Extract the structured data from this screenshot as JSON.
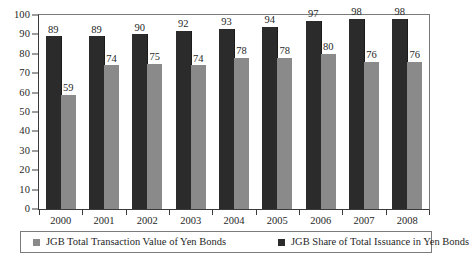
{
  "chart_data": {
    "type": "bar",
    "title": "",
    "subtitle": "",
    "xlabel": "",
    "ylabel": "",
    "ylim": [
      0,
      100
    ],
    "ytick_step": 10,
    "yticks": [
      100,
      90,
      80,
      70,
      60,
      50,
      40,
      30,
      20,
      10,
      0
    ],
    "grid": false,
    "legend_position": "bottom",
    "categories": [
      "2000",
      "2001",
      "2002",
      "2003",
      "2004",
      "2005",
      "2006",
      "2007",
      "2008"
    ],
    "series": [
      {
        "name": "JGB Total Transaction Value of Yen Bonds",
        "color": "#2b2b2b",
        "values": [
          89,
          89,
          90,
          92,
          93,
          94,
          97,
          98,
          98
        ]
      },
      {
        "name": "JGB Share of Total Issuance in Yen Bonds",
        "color": "#8a8a8a",
        "values": [
          59,
          74,
          75,
          74,
          78,
          78,
          80,
          76,
          76
        ]
      }
    ]
  },
  "legend": {
    "entries": [
      {
        "label": "JGB Total Transaction Value of Yen Bonds",
        "color": "#8a8a8a"
      },
      {
        "label": "JGB Share of Total Issuance in Yen Bonds",
        "color": "#2b2b2b"
      }
    ]
  },
  "caption": {
    "text": ""
  }
}
